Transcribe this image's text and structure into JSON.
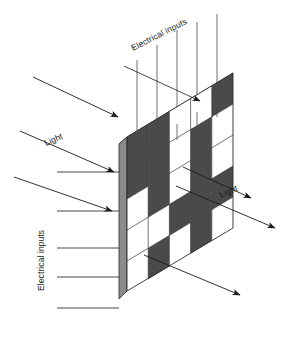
{
  "figure": {
    "background_color": "#ffffff"
  },
  "labels": {
    "electrical_inputs_top": "Electrical inputs",
    "electrical_inputs_left": "Electrical inputs",
    "light_in": "Light",
    "light_out": "Light"
  },
  "colors": {
    "cell_dark": "#4a4a4a",
    "cell_light": "#ffffff",
    "edge_top_face": "#555555",
    "edge_side_face": "#8a8a8a",
    "outline": "#2b2b2b",
    "wire": "#4d4d4d",
    "arrow": "#1a1a1a",
    "text": "#1a1a1a"
  },
  "panel": {
    "rows": 5,
    "columns": 5,
    "pattern_name": "checkerboard",
    "cells": [
      [
        "dark",
        "dark",
        "light",
        "light",
        "dark"
      ],
      [
        "dark",
        "dark",
        "light",
        "dark",
        "light"
      ],
      [
        "light",
        "dark",
        "light",
        "dark",
        "light"
      ],
      [
        "light",
        "light",
        "dark",
        "dark",
        "dark"
      ],
      [
        "light",
        "dark",
        "light",
        "dark",
        "light"
      ]
    ]
  },
  "wires": {
    "top_count": 5,
    "left_count": 5
  },
  "arrows": {
    "light_in_count": 2,
    "light_out_count": 3,
    "electrical_pointer_count": 2
  }
}
